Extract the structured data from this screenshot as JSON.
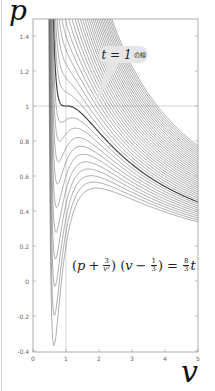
{
  "chart_data": {
    "type": "line",
    "title": "",
    "xlabel": "v",
    "ylabel": "p",
    "xlim": [
      0,
      5
    ],
    "ylim": [
      -0.4,
      1.5
    ],
    "x_ticks": [
      "0",
      "1",
      "2",
      "3",
      "4",
      "5"
    ],
    "y_ticks": [
      "-0.4",
      "-0.2",
      "0",
      "0.2",
      "0.4",
      "0.6",
      "0.8",
      "1",
      "1.2",
      "1.4"
    ],
    "grid": {
      "reference_lines": [
        {
          "axis": "x",
          "value": 1
        },
        {
          "axis": "y",
          "value": 1
        }
      ]
    },
    "equation": "(p + 3/v²)(v − 1/3) = (8/3) t",
    "series_description": "Family of reduced van der Waals isotherms p = 8t/(3v−1) − 3/v², t from ~0.80 to ~1.56",
    "t_start": 0.8,
    "t_end": 1.56,
    "t_step": 0.02,
    "highlighted_series": {
      "t": 1,
      "label": "t = 1 の線"
    },
    "sample_values": {
      "t=1_at_v=5": 0.451,
      "t=0.8_min_near_v=0.6": -0.37,
      "t=1.56_at_v=5": 0.77
    },
    "legend": []
  },
  "labels": {
    "y_axis": "p",
    "x_axis": "v",
    "callout_main": "t = 1",
    "callout_suffix": "の線",
    "eq_p": "p",
    "eq_plus": "+",
    "eq_frac1_num": "3",
    "eq_frac1_den": "v²",
    "eq_v": "v",
    "eq_minus": "−",
    "eq_frac2_num": "1",
    "eq_frac2_den": "3",
    "eq_equals": "=",
    "eq_frac3_num": "8",
    "eq_frac3_den": "3",
    "eq_t": "t"
  },
  "colors": {
    "curve": "#555555",
    "highlight_curve": "#444444",
    "reference_line": "#cccccc",
    "axis": "#999999",
    "callout_bg": "#e6e6e6"
  }
}
